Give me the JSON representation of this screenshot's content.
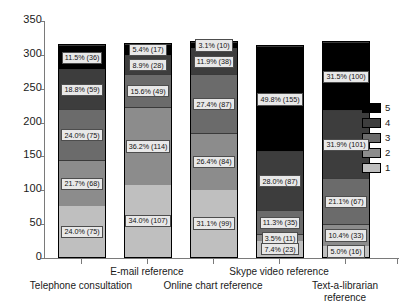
{
  "chart_data": {
    "type": "bar",
    "stacked": true,
    "title": "",
    "subtitle": "",
    "xlabel": "",
    "ylabel": "",
    "ylim": [
      0,
      350
    ],
    "ytick_labels": [
      "0",
      "50",
      "100",
      "150",
      "200",
      "250",
      "300",
      "350"
    ],
    "yticks": [
      0,
      50,
      100,
      150,
      200,
      250,
      300,
      350
    ],
    "grid": false,
    "legend_position": "right",
    "categories": [
      "Telephone consultation",
      "E-mail reference",
      "Online chart reference",
      "Skype video reference",
      "Text-a-librarian reference"
    ],
    "legend_entries": [
      "5",
      "4",
      "3",
      "2",
      "1"
    ],
    "series": [
      {
        "name": "1",
        "color": "#bfbfbf",
        "values": [
          75,
          107,
          99,
          23,
          16
        ],
        "percents": [
          "24.0%",
          "34.0%",
          "31.1%",
          "7.4%",
          "5.0%"
        ],
        "labels": [
          "24.0% (75)",
          "34.0% (107)",
          "31.1% (99)",
          "7.4% (23)",
          "5.0% (16)"
        ]
      },
      {
        "name": "2",
        "color": "#8c8c8c",
        "values": [
          68,
          114,
          84,
          11,
          33
        ],
        "percents": [
          "21.7%",
          "36.2%",
          "26.4%",
          "3.5%",
          "10.4%"
        ],
        "labels": [
          "21.7% (68)",
          "36.2% (114)",
          "26.4% (84)",
          "3.5% (11)",
          "10.4% (33)"
        ]
      },
      {
        "name": "3",
        "color": "#6b6b6b",
        "values": [
          75,
          49,
          87,
          35,
          67
        ],
        "percents": [
          "24.0%",
          "15.6%",
          "27.4%",
          "11.3%",
          "21.1%"
        ],
        "labels": [
          "24.0% (75)",
          "15.6% (49)",
          "27.4% (87)",
          "11.3% (35)",
          "21.1% (67)"
        ]
      },
      {
        "name": "4",
        "color": "#3d3d3d",
        "values": [
          59,
          28,
          38,
          87,
          101
        ],
        "percents": [
          "18.8%",
          "8.9%",
          "11.9%",
          "28.0%",
          "31.9%"
        ],
        "labels": [
          "18.8% (59)",
          "8.9% (28)",
          "11.9% (38)",
          "28.0% (87)",
          "31.9% (101)"
        ]
      },
      {
        "name": "5",
        "color": "#000000",
        "values": [
          36,
          17,
          10,
          155,
          100
        ],
        "percents": [
          "11.5%",
          "5.4%",
          "3.1%",
          "49.8%",
          "31.5%"
        ],
        "labels": [
          "11.5% (36)",
          "5.4% (17)",
          "3.1% (10)",
          "49.8% (155)",
          "31.5% (100)"
        ]
      }
    ],
    "totals": [
      313,
      315,
      318,
      311,
      317
    ]
  },
  "axis": {
    "y_labels": [
      "350",
      "300",
      "250",
      "200",
      "150",
      "100",
      "50",
      "0"
    ]
  },
  "category_labels": [
    "Telephone consultation",
    "E-mail reference",
    "Online chart reference",
    "Skype video reference",
    "Text-a-librarian\nreference"
  ],
  "legend": {
    "items": [
      {
        "label": "5",
        "color": "#000000"
      },
      {
        "label": "4",
        "color": "#3d3d3d"
      },
      {
        "label": "3",
        "color": "#6b6b6b"
      },
      {
        "label": "2",
        "color": "#8c8c8c"
      },
      {
        "label": "1",
        "color": "#bfbfbf"
      }
    ]
  }
}
